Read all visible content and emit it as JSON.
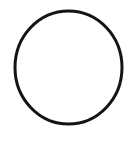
{
  "canvas": {
    "width": 136,
    "height": 141,
    "background_color": "#ffffff",
    "name": "circle-outline-image",
    "description": "Plain white image containing a single hand-drawn black circle outline"
  },
  "shapes": [
    {
      "id": "circle-1",
      "icon_name": "circle-outline-icon",
      "type": "ellipse",
      "stroke_color": "#141414",
      "fill_color": "none",
      "stroke_width": 3,
      "center_x": 68.5,
      "center_y": 67.5,
      "radius_x": 53.5,
      "radius_y": 56.5,
      "bounds": {
        "left": 15,
        "top": 11,
        "right": 122,
        "bottom": 124
      }
    }
  ]
}
